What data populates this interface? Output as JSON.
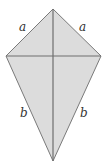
{
  "diagram": {
    "type": "kite",
    "fill_color": "#dcdcdc",
    "stroke_color": "#7a7a7a",
    "diagonal_color": "#6e6e6e",
    "vertices": {
      "top": [
        53,
        9
      ],
      "left": [
        6,
        56
      ],
      "right": [
        101,
        56
      ],
      "bottom": [
        53,
        161
      ]
    },
    "labels": {
      "upper_left": "a",
      "upper_right": "a",
      "lower_left": "b",
      "lower_right": "b"
    }
  }
}
